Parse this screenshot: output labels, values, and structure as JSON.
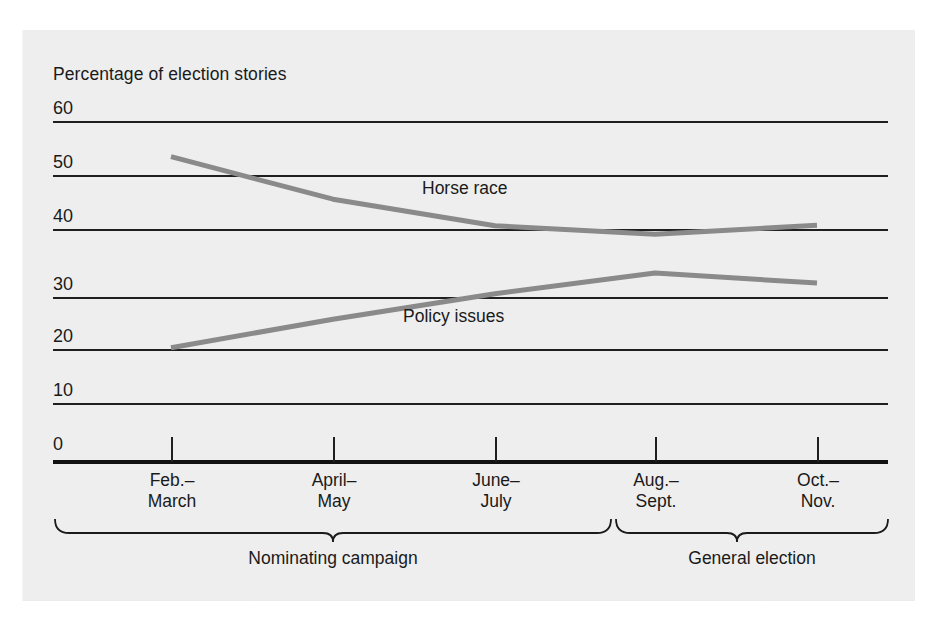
{
  "chart_data": {
    "type": "line",
    "title": "",
    "ylabel": "Percentage of election stories",
    "xlabel": "",
    "ylim": [
      0,
      60
    ],
    "yticks": [
      0,
      10,
      20,
      30,
      40,
      50,
      60
    ],
    "ytick_labels": [
      "0",
      "10",
      "20",
      "30",
      "40",
      "50",
      "60"
    ],
    "grid": true,
    "grid_axis": "y",
    "legend_position": "inline-labels",
    "categories": [
      "Feb.-\nMarch",
      "April-\nMay",
      "June-\nJuly",
      "Aug.-\nSept.",
      "Oct.-\nNov."
    ],
    "category_labels": [
      "Feb.–\nMarch",
      "April–\nMay",
      "June–\nJuly",
      "Aug.–\nSept.",
      "Oct.–\nNov."
    ],
    "series": [
      {
        "name": "Horse race",
        "values": [
          53.7,
          46.2,
          41.5,
          40.0,
          41.6
        ],
        "color": "#8a8a8a"
      },
      {
        "name": "Policy issues",
        "values": [
          20.0,
          25.0,
          29.5,
          33.2,
          31.4
        ],
        "color": "#8a8a8a"
      }
    ],
    "group_brackets": [
      {
        "label": "Nominating campaign",
        "categories": [
          "Feb.-March",
          "April-May",
          "June-July"
        ]
      },
      {
        "label": "General election",
        "categories": [
          "Aug.-Sept.",
          "Oct.-Nov."
        ]
      }
    ],
    "annotations": [
      {
        "text": "Horse race",
        "series": "Horse race"
      },
      {
        "text": "Policy issues",
        "series": "Policy issues"
      }
    ],
    "colors": {
      "panel_background": "#eeeeee",
      "grid": "#1f1f1f",
      "axis": "#111111",
      "text": "#1a1a1a",
      "series_line": "#8a8a8a"
    }
  },
  "labels": {
    "ylabel": "Percentage of election stories",
    "y60": "60",
    "y50": "50",
    "y40": "40",
    "y30": "30",
    "y20": "20",
    "y10": "10",
    "y0": "0",
    "x1": "Feb.–\nMarch",
    "x2": "April–\nMay",
    "x3": "June–\nJuly",
    "x4": "Aug.–\nSept.",
    "x5": "Oct.–\nNov.",
    "series1": "Horse race",
    "series2": "Policy issues",
    "group1": "Nominating campaign",
    "group2": "General election"
  }
}
